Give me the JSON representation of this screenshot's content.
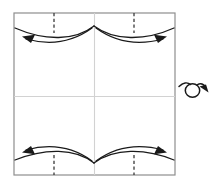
{
  "figure": {
    "caption_fragment": "",
    "colors": {
      "paper_edge": "#8e8e8e",
      "crease_line": "#d2d2d2",
      "fold_dash": "#3a3a3a",
      "arrow": "#1a1a1a",
      "background": "#ffffff"
    }
  },
  "paper": {
    "name": "square-sheet",
    "left": 14,
    "top": 13,
    "right": 175,
    "bottom": 175,
    "edge_width": 1.2
  },
  "creases": [
    {
      "name": "vertical-center-crease",
      "orientation": "vertical",
      "position": 94.5
    },
    {
      "name": "horizontal-center-crease",
      "orientation": "horizontal",
      "position": 96.5
    }
  ],
  "fold_lines": [
    {
      "name": "fold-line-top-left",
      "x": 54,
      "y1": 13,
      "y2": 33
    },
    {
      "name": "fold-line-top-right",
      "x": 134,
      "y1": 13,
      "y2": 33
    },
    {
      "name": "fold-line-bottom-left",
      "x": 54,
      "y1": 155,
      "y2": 175
    },
    {
      "name": "fold-line-bottom-right",
      "x": 134,
      "y1": 155,
      "y2": 175
    }
  ],
  "edge_curves": [
    {
      "name": "top-left-edge-curve",
      "path": "M 15,28 C 45,41 75,41 94,26",
      "note": "curved top-left raw edge"
    },
    {
      "name": "top-right-edge-curve",
      "path": "M 94,26 C 114,41 145,41 174,28",
      "note": "curved top-right raw edge"
    },
    {
      "name": "bottom-left-edge-curve",
      "path": "M 15,160 C 45,148 75,148 94,163",
      "note": "curved bottom-left raw edge"
    },
    {
      "name": "bottom-right-edge-curve",
      "path": "M 94,163 C 114,148 145,148 174,160",
      "note": "curved bottom-right raw edge"
    }
  ],
  "arrows": [
    {
      "name": "fold-arrow-top-left",
      "direction": "left",
      "path": "M 92,28 C 70,44 48,45 26,39",
      "head": "22,36.5 34,35.5 31,42.5"
    },
    {
      "name": "fold-arrow-top-right",
      "direction": "right",
      "path": "M 96,28 C 118,44 141,45 163,39",
      "head": "167,36.5 155,35.5 158,42.5"
    },
    {
      "name": "fold-arrow-bottom-left",
      "direction": "left",
      "path": "M 92,161 C 70,145 48,144 26,150",
      "head": "22,152.5 34,153.5 31,146.5"
    },
    {
      "name": "fold-arrow-bottom-right",
      "direction": "right",
      "path": "M 96,161 C 118,145 141,144 163,150",
      "head": "167,152.5 155,153.5 158,146.5"
    }
  ],
  "flip_icon": {
    "name": "flip-over-icon",
    "label": "turn over",
    "cx": 193,
    "cy": 90,
    "loop_rx": 7.5,
    "loop_ry": 7,
    "tail_path": "M 179,86 C 183,82 188,82 190,84",
    "lead_path": "M 197,85 C 201,83 204,85 206,88",
    "head": "208,93 199,87 206,85"
  }
}
